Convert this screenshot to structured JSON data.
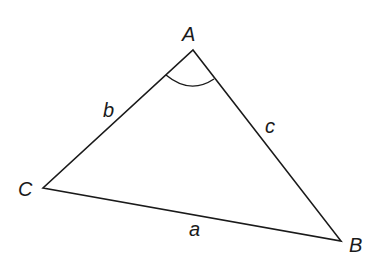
{
  "diagram": {
    "type": "triangle",
    "vertices": [
      {
        "id": "A",
        "label": "A",
        "x": 193,
        "y": 50
      },
      {
        "id": "B",
        "label": "B",
        "x": 341,
        "y": 241
      },
      {
        "id": "C",
        "label": "C",
        "x": 43,
        "y": 188
      }
    ],
    "sides": [
      {
        "id": "a",
        "label": "a",
        "from": "B",
        "to": "C"
      },
      {
        "id": "b",
        "label": "b",
        "from": "A",
        "to": "C"
      },
      {
        "id": "c",
        "label": "c",
        "from": "A",
        "to": "B"
      }
    ],
    "angle_marker": {
      "at": "A"
    },
    "stroke_color": "#1a1a1a",
    "background_color": "#ffffff"
  }
}
